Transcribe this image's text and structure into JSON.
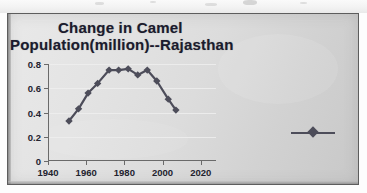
{
  "chart_data": {
    "type": "line",
    "title": "Change in  Camel Population(million)--Rajasthan",
    "title_line1": "Change in  Camel",
    "title_line2": "Population(million)--Rajasthan",
    "xlabel": "",
    "ylabel": "",
    "xlim": [
      1940,
      2028
    ],
    "ylim": [
      0,
      0.8
    ],
    "xticks": [
      "1940",
      "1960",
      "1980",
      "2000",
      "2020"
    ],
    "xtick_values": [
      1940,
      1960,
      1980,
      2000,
      2020
    ],
    "yticks": [
      "0",
      "0.2",
      "0.4",
      "0.6",
      "0.8"
    ],
    "ytick_values": [
      0,
      0.2,
      0.4,
      0.6,
      0.8
    ],
    "grid": "horizontal-faint",
    "legend": "none",
    "legend_marker": "diamond-line",
    "marker": "diamond",
    "series": [
      {
        "name": "Camel Population (million)",
        "color": "#4d4d5a",
        "x": [
          1951,
          1956,
          1961,
          1966,
          1972,
          1977,
          1982,
          1987,
          1992,
          1997,
          2003,
          2007
        ],
        "values": [
          0.33,
          0.43,
          0.56,
          0.64,
          0.75,
          0.75,
          0.76,
          0.71,
          0.75,
          0.66,
          0.51,
          0.42
        ]
      }
    ]
  },
  "figure": {
    "background_color": "#dcdcdc",
    "frame_color": "#5d5d5d",
    "title_color": "#1b1b2e",
    "axis_color": "#6a6a6a"
  }
}
